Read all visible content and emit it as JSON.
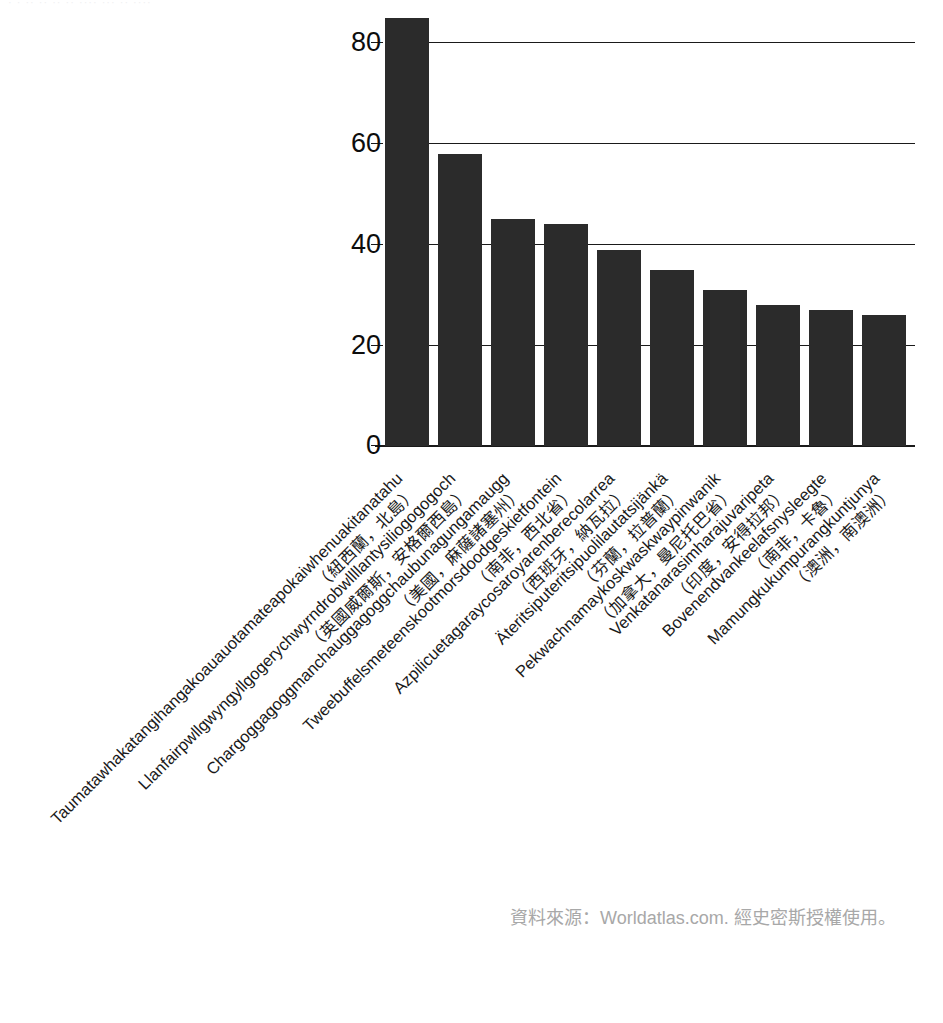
{
  "clipped_header": "· · ·· ·· ·· ·· ···· ··· ·· ····",
  "source_note": "資料來源：Worldatlas.com. 經史密斯授權使用。",
  "chart_data": {
    "type": "bar",
    "title": "",
    "subtitle": "",
    "xlabel": "",
    "ylabel": "",
    "ylim": [
      0,
      85
    ],
    "yticks": [
      0,
      20,
      40,
      60,
      80
    ],
    "ytick_labels": [
      "0",
      "20",
      "40",
      "60",
      "80"
    ],
    "grid": true,
    "gridlines_at": [
      20,
      40,
      60,
      80
    ],
    "legend": null,
    "bar_color": "#2b2b2b",
    "axis_color": "#1a1a1a",
    "categories": [
      "Taumatawhakatangihangakoauauotamateapokaiwhenuakitanatahu",
      "Llanfairpwllgwyngyllgogerychwyrndrobwllllantysiliogogogoch",
      "Chargoggagoggmanchauggagoggchaubunagungamaugg",
      "Tweebuffelsmeteenskootmorsdoodgeskietfontein",
      "Azpilicuetagaraycosaroyarenberecolarrea",
      "Äteritsiputeritsipuolilautatsijänkä",
      "Pekwachnamaykoskwaskwaypinwanik",
      "Venkatanarasimharajuvaripeta",
      "Bovenendvankeelafsnysleegte",
      "Mamungkukumpurangkuntjunya"
    ],
    "category_subtitles": [
      "（紐西蘭，北島）",
      "（英國威爾斯，安格爾西島）",
      "（美國，麻薩諸塞州）",
      "（南非，西北省）",
      "（西班牙，納瓦拉）",
      "（芬蘭，拉普蘭）",
      "（加拿大，曼尼托巴省）",
      "（印度，安得拉邦）",
      "（南非，卡魯）",
      "（澳洲，南澳洲）"
    ],
    "values": [
      85,
      58,
      45,
      44,
      39,
      35,
      31,
      28,
      27,
      26
    ],
    "series": [
      {
        "name": "字母數",
        "values": [
          85,
          58,
          45,
          44,
          39,
          35,
          31,
          28,
          27,
          26
        ]
      }
    ]
  }
}
